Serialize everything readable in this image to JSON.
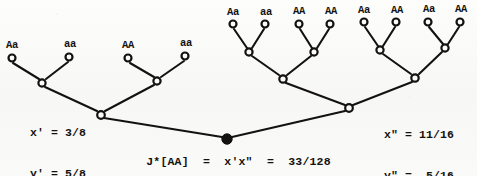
{
  "figure": {
    "kind": "genetics-pedigree-binary-tree",
    "ink_color": "#14120f",
    "paper_color": "#fbfbfa"
  },
  "left_subtree": {
    "leaf_labels": [
      "Aa",
      "aa",
      "AA",
      "aa"
    ],
    "leaf_nodes": [
      {
        "x": 12,
        "y": 58
      },
      {
        "x": 69,
        "y": 57
      },
      {
        "x": 128,
        "y": 58
      },
      {
        "x": 185,
        "y": 56
      }
    ],
    "internal_nodes": [
      {
        "x": 42,
        "y": 83
      },
      {
        "x": 157,
        "y": 81
      }
    ],
    "root_node": {
      "x": 101,
      "y": 115
    },
    "label_positions": [
      {
        "x": 12,
        "y": 40
      },
      {
        "x": 70,
        "y": 39
      },
      {
        "x": 128,
        "y": 40
      },
      {
        "x": 186,
        "y": 38
      }
    ]
  },
  "right_subtree": {
    "leaf_labels": [
      "Aa",
      "aa",
      "AA",
      "AA",
      "Aa",
      "AA",
      "Aa",
      "AA"
    ],
    "leaf_nodes": [
      {
        "x": 233,
        "y": 24
      },
      {
        "x": 265,
        "y": 24
      },
      {
        "x": 299,
        "y": 24
      },
      {
        "x": 330,
        "y": 24
      },
      {
        "x": 364,
        "y": 22
      },
      {
        "x": 396,
        "y": 22
      },
      {
        "x": 428,
        "y": 22
      },
      {
        "x": 460,
        "y": 22
      }
    ],
    "parent_nodes": [
      {
        "x": 249,
        "y": 52
      },
      {
        "x": 314,
        "y": 52
      },
      {
        "x": 380,
        "y": 50
      },
      {
        "x": 445,
        "y": 48
      }
    ],
    "grandparent_nodes": [
      {
        "x": 283,
        "y": 79
      },
      {
        "x": 415,
        "y": 78
      }
    ],
    "root_node": {
      "x": 349,
      "y": 108
    },
    "label_positions": [
      {
        "x": 233,
        "y": 7
      },
      {
        "x": 266,
        "y": 7
      },
      {
        "x": 299,
        "y": 6
      },
      {
        "x": 331,
        "y": 6
      },
      {
        "x": 364,
        "y": 5
      },
      {
        "x": 397,
        "y": 5
      },
      {
        "x": 429,
        "y": 4
      },
      {
        "x": 461,
        "y": 4
      }
    ]
  },
  "root": {
    "node": {
      "x": 227,
      "y": 139
    },
    "filled": true
  },
  "annotations": {
    "left": {
      "line1": "x' = 3/8",
      "line2": "y' = 5/8"
    },
    "right": {
      "line1": "x\" = 11/16",
      "line2": "y\" =  5/16"
    },
    "formula": "J*[AA]  =  x'x\"  =  33/128",
    "formula_symbol": "J*",
    "formula_genotype": "[AA]",
    "formula_product": "x'x\"",
    "formula_value": "33/128"
  }
}
